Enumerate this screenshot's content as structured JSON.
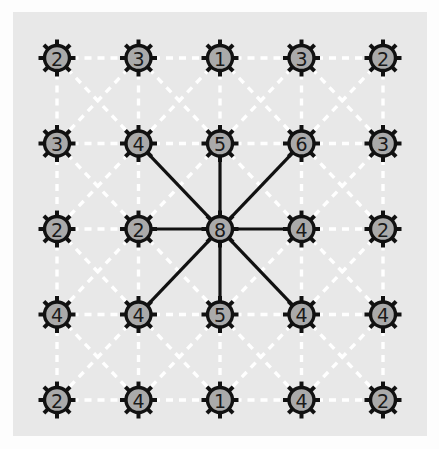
{
  "figure": {
    "panel": {
      "background_color": "#e8e8e8",
      "x": 13,
      "y": 12,
      "width": 414,
      "height": 424
    },
    "page_background_color": "#fdfdfd"
  },
  "style": {
    "node_fill_color": "#aaaaaa",
    "node_ring_color": "#111111",
    "node_label_color": "#1a1a1a",
    "dashed_edge_color": "#ffffff",
    "solid_edge_color": "#111111",
    "node_outer_radius": 17,
    "node_inner_radius": 12.5,
    "spoke_count": 8
  },
  "chart_data": {
    "type": "diagram",
    "rows": 5,
    "cols": 5,
    "origin": {
      "x": 57,
      "y": 58
    },
    "spacing": {
      "x": 81.5,
      "y": 85.5
    },
    "grid_values": [
      [
        2,
        3,
        1,
        3,
        2
      ],
      [
        3,
        4,
        5,
        6,
        3
      ],
      [
        2,
        2,
        8,
        4,
        2
      ],
      [
        4,
        4,
        5,
        4,
        4
      ],
      [
        2,
        4,
        1,
        4,
        2
      ]
    ],
    "nodes": [
      {
        "id": "r0c0",
        "row": 0,
        "col": 0,
        "value": 2
      },
      {
        "id": "r0c1",
        "row": 0,
        "col": 1,
        "value": 3
      },
      {
        "id": "r0c2",
        "row": 0,
        "col": 2,
        "value": 1
      },
      {
        "id": "r0c3",
        "row": 0,
        "col": 3,
        "value": 3
      },
      {
        "id": "r0c4",
        "row": 0,
        "col": 4,
        "value": 2
      },
      {
        "id": "r1c0",
        "row": 1,
        "col": 0,
        "value": 3
      },
      {
        "id": "r1c1",
        "row": 1,
        "col": 1,
        "value": 4
      },
      {
        "id": "r1c2",
        "row": 1,
        "col": 2,
        "value": 5
      },
      {
        "id": "r1c3",
        "row": 1,
        "col": 3,
        "value": 6
      },
      {
        "id": "r1c4",
        "row": 1,
        "col": 4,
        "value": 3
      },
      {
        "id": "r2c0",
        "row": 2,
        "col": 0,
        "value": 2
      },
      {
        "id": "r2c1",
        "row": 2,
        "col": 1,
        "value": 2
      },
      {
        "id": "r2c2",
        "row": 2,
        "col": 2,
        "value": 8
      },
      {
        "id": "r2c3",
        "row": 2,
        "col": 3,
        "value": 4
      },
      {
        "id": "r2c4",
        "row": 2,
        "col": 4,
        "value": 2
      },
      {
        "id": "r3c0",
        "row": 3,
        "col": 0,
        "value": 4
      },
      {
        "id": "r3c1",
        "row": 3,
        "col": 1,
        "value": 4
      },
      {
        "id": "r3c2",
        "row": 3,
        "col": 2,
        "value": 5
      },
      {
        "id": "r3c3",
        "row": 3,
        "col": 3,
        "value": 4
      },
      {
        "id": "r3c4",
        "row": 3,
        "col": 4,
        "value": 4
      },
      {
        "id": "r4c0",
        "row": 4,
        "col": 0,
        "value": 2
      },
      {
        "id": "r4c1",
        "row": 4,
        "col": 1,
        "value": 4
      },
      {
        "id": "r4c2",
        "row": 4,
        "col": 2,
        "value": 1
      },
      {
        "id": "r4c3",
        "row": 4,
        "col": 3,
        "value": 4
      },
      {
        "id": "r4c4",
        "row": 4,
        "col": 4,
        "value": 2
      }
    ],
    "highlight_node": {
      "id": "r2c2",
      "row": 2,
      "col": 2,
      "value": 8,
      "degree": 8
    },
    "highlighted_edges": [
      {
        "from": "r2c2",
        "to": "r1c1",
        "style": "solid"
      },
      {
        "from": "r2c2",
        "to": "r1c2",
        "style": "solid"
      },
      {
        "from": "r2c2",
        "to": "r1c3",
        "style": "solid"
      },
      {
        "from": "r2c2",
        "to": "r2c1",
        "style": "solid"
      },
      {
        "from": "r2c2",
        "to": "r2c3",
        "style": "solid"
      },
      {
        "from": "r2c2",
        "to": "r3c1",
        "style": "solid"
      },
      {
        "from": "r2c2",
        "to": "r3c2",
        "style": "solid"
      },
      {
        "from": "r2c2",
        "to": "r3c3",
        "style": "solid"
      }
    ],
    "edge_rule": "every node connects to all 8 neighbours (king-move adjacency); edges incident to the centre node are solid black, all others are white dashed",
    "legend": [],
    "annotations": []
  }
}
